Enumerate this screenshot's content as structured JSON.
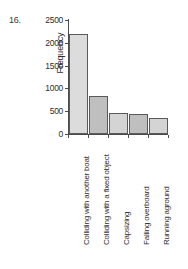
{
  "item_number": "16.",
  "chart_data": {
    "type": "bar",
    "title": "",
    "xlabel": "",
    "ylabel": "Frequency",
    "ylim": [
      0,
      2500
    ],
    "grid": false,
    "legend": false,
    "categories": [
      "Colliding with another boat",
      "Colliding with a fixed object",
      "Capsizing",
      "Falling overboard",
      "Running aground"
    ],
    "values": [
      2200,
      830,
      460,
      430,
      350
    ],
    "yticks": [
      0,
      500,
      1000,
      1500,
      2000,
      2500
    ],
    "ytick_labels": [
      "0",
      "500",
      "1000",
      "1500",
      "2000",
      "2500"
    ],
    "bar_colors": [
      "#dcdcdc",
      "#bfbfbf",
      "#d4d4d4",
      "#bfbfbf",
      "#d4d4d4"
    ]
  }
}
